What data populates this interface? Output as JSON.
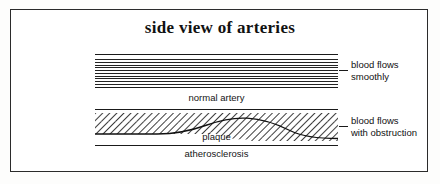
{
  "figure": {
    "title": "side view of arteries",
    "border_color": "#2b2b2b",
    "ink_color": "#1a1a1a",
    "background_color": "#ffffff"
  },
  "diagrams": [
    {
      "id": "normal-artery",
      "caption": "normal artery",
      "flow_line_count": 10,
      "callout": {
        "line1": "blood flows",
        "line2": "smoothly"
      }
    },
    {
      "id": "atherosclerotic-artery",
      "caption": "atherosclerosis",
      "inner_label": "plaque",
      "hatch_angle_deg": 45,
      "callout": {
        "line1": "blood flows",
        "line2": "with obstruction"
      }
    }
  ]
}
